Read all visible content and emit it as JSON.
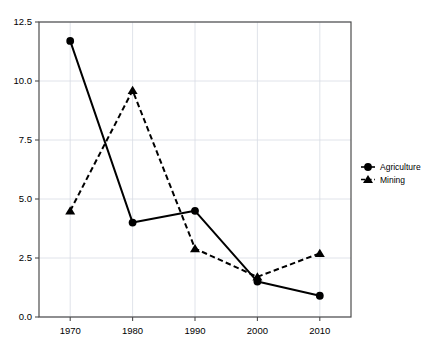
{
  "chart_data": {
    "type": "line",
    "title": "",
    "subtitle": "",
    "xlabel": "",
    "ylabel": "",
    "x": [
      1970,
      1980,
      1990,
      2000,
      2010
    ],
    "categories": [
      "1970",
      "1980",
      "1990",
      "2000",
      "2010"
    ],
    "xtick_labels": [
      "1970",
      "1980",
      "1990",
      "2000",
      "2010"
    ],
    "ytick_labels": [
      "0.0",
      "2.5",
      "5.0",
      "7.5",
      "10.0",
      "12.5"
    ],
    "ytick_values": [
      0.0,
      2.5,
      5.0,
      7.5,
      10.0,
      12.5
    ],
    "xlim": [
      1965,
      2015
    ],
    "ylim": [
      0.0,
      12.5
    ],
    "grid": true,
    "grid_color": "#d8dce4",
    "legend_position": "right",
    "series": [
      {
        "name": "Agriculture",
        "marker": "circle",
        "linestyle": "solid",
        "color": "#000000",
        "values": [
          11.7,
          4.0,
          4.5,
          1.5,
          0.9
        ]
      },
      {
        "name": "Mining",
        "marker": "triangle",
        "linestyle": "dashed",
        "color": "#000000",
        "values": [
          4.5,
          9.6,
          2.9,
          1.7,
          2.7
        ]
      }
    ]
  },
  "legend": {
    "entries": [
      {
        "label": "Agriculture",
        "marker_icon": "circle-marker-icon"
      },
      {
        "label": "Mining",
        "marker_icon": "triangle-marker-icon"
      }
    ]
  },
  "axes": {
    "frame_color": "#4d4d4d",
    "background": "#ffffff"
  }
}
